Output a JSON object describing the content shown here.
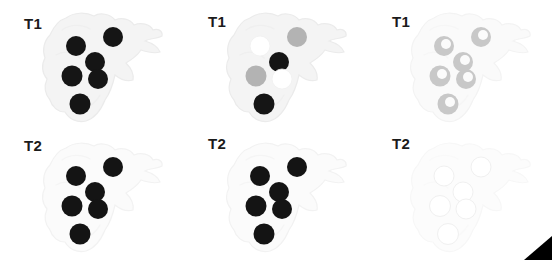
{
  "figure": {
    "background_color": "#ffffff",
    "rows": 2,
    "columns": 3,
    "panel_width": 184,
    "panel_height": 130
  },
  "panels": [
    {
      "id": "t1-col1",
      "label": "T1",
      "label_x": 24,
      "label_y": 16,
      "row": 0,
      "column": 0,
      "origin_x": 0,
      "origin_y": 0,
      "tissue_fill": "#f4f4f4",
      "tissue_stroke": "#ebebeb",
      "lesion_style": "solid-dark",
      "lesion_fill": "#151515",
      "lesion_rim": "#151515",
      "lesion_core": "#151515",
      "lesion_opacity": 1
    },
    {
      "id": "t1-col2",
      "label": "T1",
      "label_x": 24,
      "label_y": 14,
      "row": 0,
      "column": 1,
      "origin_x": 184,
      "origin_y": 0,
      "tissue_fill": "#f4f4f4",
      "tissue_stroke": "#ebebeb",
      "lesion_style": "mixed",
      "lesion_fill": "#151515",
      "lesion_rim": "#151515",
      "lesion_core": "#151515",
      "lesion_opacity": 1
    },
    {
      "id": "t1-col3",
      "label": "T1",
      "label_x": 24,
      "label_y": 14,
      "row": 0,
      "column": 2,
      "origin_x": 368,
      "origin_y": 0,
      "tissue_fill": "#fafafa",
      "tissue_stroke": "#f3f3f3",
      "lesion_style": "ring",
      "lesion_fill": "#c8c8c8",
      "lesion_rim": "#bdbdbd",
      "lesion_core": "#fbfbfb",
      "lesion_opacity": 1
    },
    {
      "id": "t2-col1",
      "label": "T2",
      "label_x": 24,
      "label_y": 138,
      "row": 1,
      "column": 0,
      "origin_x": 0,
      "origin_y": 130,
      "tissue_fill": "#fbfbfb",
      "tissue_stroke": "#f2f2f2",
      "lesion_style": "solid-dark",
      "lesion_fill": "#141414",
      "lesion_rim": "#141414",
      "lesion_core": "#141414",
      "lesion_opacity": 1
    },
    {
      "id": "t2-col2",
      "label": "T2",
      "label_x": 24,
      "label_y": 136,
      "row": 1,
      "column": 1,
      "origin_x": 184,
      "origin_y": 130,
      "tissue_fill": "#fbfbfb",
      "tissue_stroke": "#f2f2f2",
      "lesion_style": "solid-dark",
      "lesion_fill": "#141414",
      "lesion_rim": "#141414",
      "lesion_core": "#141414",
      "lesion_opacity": 1
    },
    {
      "id": "t2-col3",
      "label": "T2",
      "label_x": 24,
      "label_y": 136,
      "row": 1,
      "column": 2,
      "origin_x": 368,
      "origin_y": 130,
      "tissue_fill": "#fcfcfc",
      "tissue_stroke": "#f7f7f7",
      "lesion_style": "solid-bright",
      "lesion_fill": "#ffffff",
      "lesion_rim": "#f0f0f0",
      "lesion_core": "#ffffff",
      "lesion_opacity": 1
    }
  ],
  "lesion_layout": {
    "description": "Six lesion foci arranged identically in every panel, coordinates relative to the panel box.",
    "count": 6,
    "points": [
      {
        "name": "upper-left",
        "cx": 76,
        "cy": 46,
        "r": 10
      },
      {
        "name": "upper-right",
        "cx": 113,
        "cy": 37,
        "r": 10
      },
      {
        "name": "center",
        "cx": 95,
        "cy": 62,
        "r": 10
      },
      {
        "name": "mid-left",
        "cx": 72,
        "cy": 76,
        "r": 10.5
      },
      {
        "name": "mid-right",
        "cx": 98,
        "cy": 79,
        "r": 10
      },
      {
        "name": "lower-left",
        "cx": 80,
        "cy": 104,
        "r": 10.5
      }
    ]
  },
  "lesion_intensity_by_panel": {
    "t1-col1": [
      "dark",
      "dark",
      "dark",
      "dark",
      "dark",
      "dark"
    ],
    "t1-col2": [
      "bright",
      "gray",
      "dark",
      "gray",
      "bright",
      "dark"
    ],
    "t1-col3": [
      "ring",
      "ring",
      "ring",
      "ring",
      "ring",
      "ring"
    ],
    "t2-col1": [
      "dark",
      "dark",
      "dark",
      "dark",
      "dark",
      "dark"
    ],
    "t2-col2": [
      "dark",
      "dark",
      "dark",
      "dark",
      "dark",
      "dark"
    ],
    "t2-col3": [
      "bright",
      "bright",
      "bright",
      "bright",
      "bright",
      "bright"
    ]
  },
  "intensity_colors": {
    "dark": "#141414",
    "gray": "#b3b3b3",
    "bright": "#ffffff",
    "ring_rim": "#bdbdbd",
    "ring_core": "#fbfbfb"
  },
  "corner_marker": {
    "name": "arrowhead",
    "shape": "right-pointing-triangle",
    "color": "#000000",
    "x": 524,
    "y": 236,
    "width": 28,
    "height": 24
  }
}
